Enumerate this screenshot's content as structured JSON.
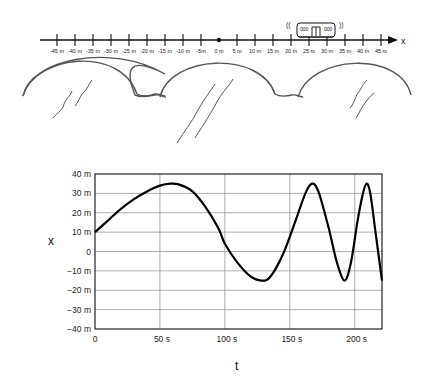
{
  "number_line": {
    "axis_label": "x",
    "ticks": [
      "-45 m",
      "-40 m",
      "-35 m",
      "-30 m",
      "-25 m",
      "-20 m",
      "-15 m",
      "-10 m",
      "-5m",
      "0 m",
      "5 m",
      "10 m",
      "15 m",
      "20 m",
      "25 m",
      "30 m",
      "35 m",
      "40 m",
      "45 m"
    ],
    "origin_label": "0 m",
    "train_position_m": 27,
    "train_sound_marks": [
      "((",
      "))"
    ]
  },
  "chart_data": {
    "type": "line",
    "title": "",
    "xlabel": "t",
    "ylabel": "x",
    "xlim": [
      0,
      221
    ],
    "ylim": [
      -40,
      40
    ],
    "x_ticks": [
      "0",
      "50 s",
      "100 s",
      "150 s",
      "200 s"
    ],
    "y_ticks": [
      "40 m",
      "30 m",
      "20 m",
      "10 m",
      "0",
      "-10 m",
      "-20 m",
      "-30 m",
      "-40 m"
    ],
    "grid": true,
    "legend": null,
    "series": [
      {
        "name": "x(t)",
        "x": [
          0,
          10,
          20,
          30,
          40,
          50,
          58,
          65,
          75,
          85,
          95,
          100,
          110,
          120,
          128,
          135,
          145,
          155,
          162,
          167,
          172,
          180,
          186,
          192,
          197,
          202,
          206,
          209,
          212,
          216,
          221
        ],
        "values": [
          10,
          16,
          22,
          27,
          31,
          34,
          35,
          34.5,
          31,
          23,
          12,
          4,
          -6,
          -13,
          -15,
          -13,
          -1,
          17,
          30,
          35,
          31,
          12,
          -5,
          -15,
          -6,
          15,
          29,
          35,
          30,
          10,
          -15
        ]
      }
    ]
  },
  "chart_labels": {
    "x_axis_title": "t",
    "y_axis_title": "x"
  }
}
